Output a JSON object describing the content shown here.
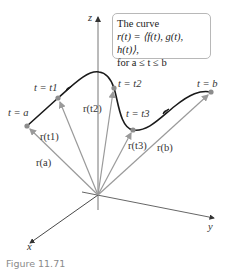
{
  "info_box": {
    "line1": "The curve",
    "line2": "r(t) = ⟨f(t), g(t), h(t)⟩,",
    "line3": "for a ≤ t ≤ b"
  },
  "axes": {
    "x": "x",
    "y": "y",
    "z": "z"
  },
  "points": [
    {
      "label": "t = a",
      "vector": "r(a)"
    },
    {
      "label": "t = t1",
      "vector": "r(t1)"
    },
    {
      "label": "t = t2",
      "vector": "r(t2)"
    },
    {
      "label": "t = t3",
      "vector": "r(t3)"
    },
    {
      "label": "t = b",
      "vector": "r(b)"
    }
  ],
  "caption": "Figure 11.71",
  "colors": {
    "curve": "#1a1a1a",
    "vector": "#9a9a9a",
    "point": "#8c8c8c",
    "axis": "#333333"
  }
}
